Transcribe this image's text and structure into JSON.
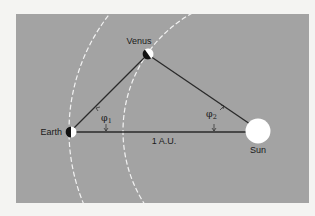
{
  "diagram": {
    "colors": {
      "page_background": "#f4f4f2",
      "panel_background": "#a3a3a3",
      "line": "#2a2a2a",
      "orbit": "#f2f2f2",
      "sun": "#ffffff",
      "planet_dark": "#111111",
      "planet_light": "#ffffff"
    },
    "bodies": {
      "earth": {
        "label": "Earth"
      },
      "venus": {
        "label": "Venus"
      },
      "sun": {
        "label": "Sun"
      }
    },
    "angles": {
      "phi1": {
        "symbol": "φ",
        "subscript": "1"
      },
      "phi2": {
        "symbol": "φ",
        "subscript": "2"
      }
    },
    "baseline_label": "1 A.U.",
    "orbits": [
      "earth-orbit",
      "venus-orbit"
    ]
  }
}
